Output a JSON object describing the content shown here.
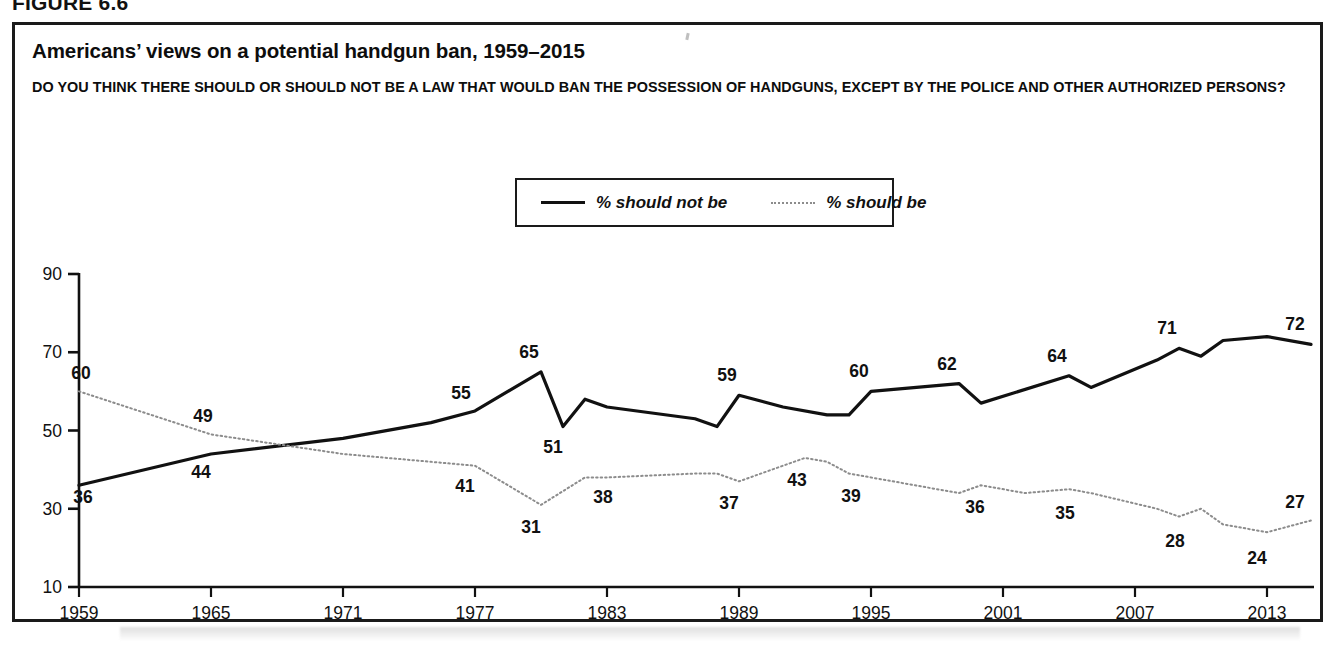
{
  "figure": {
    "label": "FIGURE 6.6"
  },
  "chart": {
    "title": "Americans’ views on a potential handgun ban, 1959–2015",
    "subtitle": "DO YOU THINK THERE SHOULD OR SHOULD NOT BE A LAW THAT WOULD BAN THE POSSESSION OF HANDGUNS, EXCEPT BY THE POLICE AND OTHER AUTHORIZED PERSONS?",
    "legend": {
      "position": "top-center",
      "items": [
        {
          "label": "% should not be",
          "style": "solid",
          "color": "#111111"
        },
        {
          "label": "% should be",
          "style": "dotted",
          "color": "#8c8c8c"
        }
      ]
    }
  },
  "chart_data": {
    "type": "line",
    "title": "Americans’ views on a potential handgun ban, 1959–2015",
    "subtitle": "DO YOU THINK THERE SHOULD OR SHOULD NOT BE A LAW THAT WOULD BAN THE POSSESSION OF HANDGUNS, EXCEPT BY THE POLICE AND OTHER AUTHORIZED PERSONS?",
    "xlabel": "",
    "ylabel": "",
    "xlim": [
      1959,
      2015
    ],
    "ylim": [
      10,
      90
    ],
    "yticks": [
      10,
      30,
      50,
      70,
      90
    ],
    "xticks": [
      1959,
      1965,
      1971,
      1977,
      1983,
      1989,
      1995,
      2001,
      2007,
      2013
    ],
    "grid": false,
    "legend_position": "top-center",
    "series": [
      {
        "name": "% should not be",
        "style": "solid",
        "color": "#111111",
        "points": [
          {
            "x": 1959,
            "y": 36
          },
          {
            "x": 1965,
            "y": 44
          },
          {
            "x": 1971,
            "y": 48
          },
          {
            "x": 1975,
            "y": 52
          },
          {
            "x": 1977,
            "y": 55
          },
          {
            "x": 1980,
            "y": 65
          },
          {
            "x": 1981,
            "y": 51
          },
          {
            "x": 1982,
            "y": 58
          },
          {
            "x": 1983,
            "y": 56
          },
          {
            "x": 1987,
            "y": 53
          },
          {
            "x": 1988,
            "y": 51
          },
          {
            "x": 1989,
            "y": 59
          },
          {
            "x": 1991,
            "y": 56
          },
          {
            "x": 1993,
            "y": 54
          },
          {
            "x": 1994,
            "y": 54
          },
          {
            "x": 1995,
            "y": 60
          },
          {
            "x": 1999,
            "y": 62
          },
          {
            "x": 2000,
            "y": 57
          },
          {
            "x": 2004,
            "y": 64
          },
          {
            "x": 2005,
            "y": 61
          },
          {
            "x": 2008,
            "y": 68
          },
          {
            "x": 2009,
            "y": 71
          },
          {
            "x": 2010,
            "y": 69
          },
          {
            "x": 2011,
            "y": 73
          },
          {
            "x": 2013,
            "y": 74
          },
          {
            "x": 2015,
            "y": 72
          }
        ],
        "labels": [
          {
            "x": 1959,
            "y": 36,
            "text": "36",
            "dx": 4,
            "dy": 18
          },
          {
            "x": 1965,
            "y": 44,
            "text": "44",
            "dx": -10,
            "dy": 24
          },
          {
            "x": 1977,
            "y": 55,
            "text": "55",
            "dx": -14,
            "dy": -12
          },
          {
            "x": 1980,
            "y": 65,
            "text": "65",
            "dx": -12,
            "dy": -14
          },
          {
            "x": 1981,
            "y": 51,
            "text": "51",
            "dx": -10,
            "dy": 26
          },
          {
            "x": 1989,
            "y": 59,
            "text": "59",
            "dx": -12,
            "dy": -14
          },
          {
            "x": 1995,
            "y": 60,
            "text": "60",
            "dx": -12,
            "dy": -14
          },
          {
            "x": 1999,
            "y": 62,
            "text": "62",
            "dx": -12,
            "dy": -14
          },
          {
            "x": 2004,
            "y": 64,
            "text": "64",
            "dx": -12,
            "dy": -14
          },
          {
            "x": 2009,
            "y": 71,
            "text": "71",
            "dx": -12,
            "dy": -14
          },
          {
            "x": 2015,
            "y": 72,
            "text": "72",
            "dx": -16,
            "dy": -14
          }
        ]
      },
      {
        "name": "% should be",
        "style": "dotted",
        "color": "#8c8c8c",
        "points": [
          {
            "x": 1959,
            "y": 60
          },
          {
            "x": 1965,
            "y": 49
          },
          {
            "x": 1971,
            "y": 44
          },
          {
            "x": 1975,
            "y": 42
          },
          {
            "x": 1977,
            "y": 41
          },
          {
            "x": 1980,
            "y": 31
          },
          {
            "x": 1982,
            "y": 38
          },
          {
            "x": 1983,
            "y": 38
          },
          {
            "x": 1987,
            "y": 39
          },
          {
            "x": 1988,
            "y": 39
          },
          {
            "x": 1989,
            "y": 37
          },
          {
            "x": 1991,
            "y": 41
          },
          {
            "x": 1992,
            "y": 43
          },
          {
            "x": 1993,
            "y": 42
          },
          {
            "x": 1994,
            "y": 39
          },
          {
            "x": 1995,
            "y": 38
          },
          {
            "x": 1999,
            "y": 34
          },
          {
            "x": 2000,
            "y": 36
          },
          {
            "x": 2002,
            "y": 34
          },
          {
            "x": 2004,
            "y": 35
          },
          {
            "x": 2005,
            "y": 34
          },
          {
            "x": 2008,
            "y": 30
          },
          {
            "x": 2009,
            "y": 28
          },
          {
            "x": 2010,
            "y": 30
          },
          {
            "x": 2011,
            "y": 26
          },
          {
            "x": 2013,
            "y": 24
          },
          {
            "x": 2015,
            "y": 27
          }
        ],
        "labels": [
          {
            "x": 1959,
            "y": 60,
            "text": "60",
            "dx": 2,
            "dy": -12
          },
          {
            "x": 1965,
            "y": 49,
            "text": "49",
            "dx": -8,
            "dy": -12
          },
          {
            "x": 1977,
            "y": 41,
            "text": "41",
            "dx": -10,
            "dy": 26
          },
          {
            "x": 1980,
            "y": 31,
            "text": "31",
            "dx": -10,
            "dy": 28
          },
          {
            "x": 1983,
            "y": 38,
            "text": "38",
            "dx": -4,
            "dy": 26
          },
          {
            "x": 1989,
            "y": 37,
            "text": "37",
            "dx": -10,
            "dy": 28
          },
          {
            "x": 1992,
            "y": 43,
            "text": "43",
            "dx": -8,
            "dy": 28
          },
          {
            "x": 1994,
            "y": 39,
            "text": "39",
            "dx": 2,
            "dy": 28
          },
          {
            "x": 2000,
            "y": 36,
            "text": "36",
            "dx": -6,
            "dy": 28
          },
          {
            "x": 2004,
            "y": 35,
            "text": "35",
            "dx": -4,
            "dy": 30
          },
          {
            "x": 2009,
            "y": 28,
            "text": "28",
            "dx": -4,
            "dy": 30
          },
          {
            "x": 2013,
            "y": 24,
            "text": "24",
            "dx": -10,
            "dy": 32
          },
          {
            "x": 2015,
            "y": 27,
            "text": "27",
            "dx": -16,
            "dy": -12
          }
        ]
      }
    ]
  }
}
